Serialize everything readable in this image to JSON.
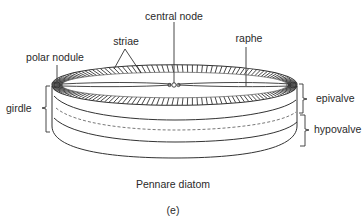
{
  "diagram": {
    "title": "Pennare diatom",
    "panel_label": "(e)",
    "labels": {
      "central_node": "central node",
      "striae": "striae",
      "polar_nodule": "polar nodule",
      "raphe": "raphe",
      "girdle": "girdle",
      "epivalve": "epivalve",
      "hypovalve": "hypovalve"
    },
    "colors": {
      "line": "#333333",
      "text": "#2a2a2a",
      "background": "#ffffff"
    }
  }
}
